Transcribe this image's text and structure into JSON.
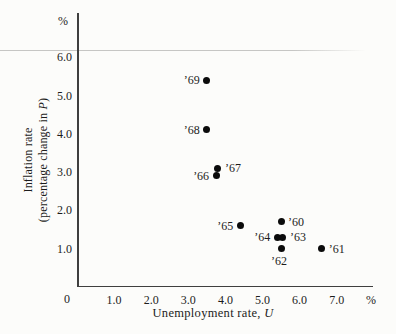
{
  "figure": {
    "background_color": "#fcfcfa",
    "axis_color": "#3f3f3f",
    "dot_color": "#0b0b0b",
    "top_rule_color": "#c6c6c4",
    "text_color": "#1c1c1c"
  },
  "chart_data": {
    "type": "scatter",
    "title": "",
    "xlabel_prefix": "Unemployment rate, ",
    "xlabel_var": "U",
    "ylabel_line1": "Inflation rate",
    "ylabel_line2_prefix": "(percentage change in ",
    "ylabel_var": "P",
    "ylabel_line2_suffix": ")",
    "x_unit": "%",
    "y_unit": "%",
    "origin_label": "0",
    "xlim": [
      0,
      8
    ],
    "ylim": [
      0,
      7.15
    ],
    "grid": false,
    "legend": "none",
    "x_ticks": [
      {
        "v": 1,
        "label": "1.0"
      },
      {
        "v": 2,
        "label": "2.0"
      },
      {
        "v": 3,
        "label": "3.0"
      },
      {
        "v": 4,
        "label": "4.0"
      },
      {
        "v": 5,
        "label": "5.0"
      },
      {
        "v": 6,
        "label": "6.0"
      },
      {
        "v": 7,
        "label": "7.0"
      }
    ],
    "y_ticks": [
      {
        "v": 1,
        "label": "1.0"
      },
      {
        "v": 2,
        "label": "2.0"
      },
      {
        "v": 3,
        "label": "3.0"
      },
      {
        "v": 4,
        "label": "4.0"
      },
      {
        "v": 5,
        "label": "5.0"
      },
      {
        "v": 6,
        "label": "6.0"
      }
    ],
    "points": [
      {
        "label": "’60",
        "x": 5.5,
        "y": 1.7,
        "label_side": "right"
      },
      {
        "label": "’61",
        "x": 6.6,
        "y": 1.0,
        "label_side": "right"
      },
      {
        "label": "’62",
        "x": 5.5,
        "y": 1.0,
        "label_side": "below"
      },
      {
        "label": "’63",
        "x": 5.55,
        "y": 1.3,
        "label_side": "right"
      },
      {
        "label": "’64",
        "x": 5.4,
        "y": 1.3,
        "label_side": "left"
      },
      {
        "label": "’65",
        "x": 4.4,
        "y": 1.6,
        "label_side": "left"
      },
      {
        "label": "’66",
        "x": 3.75,
        "y": 2.9,
        "label_side": "left"
      },
      {
        "label": "’67",
        "x": 3.8,
        "y": 3.1,
        "label_side": "right"
      },
      {
        "label": "’68",
        "x": 3.5,
        "y": 4.1,
        "label_side": "left"
      },
      {
        "label": "’69",
        "x": 3.5,
        "y": 5.4,
        "label_side": "left"
      }
    ]
  }
}
